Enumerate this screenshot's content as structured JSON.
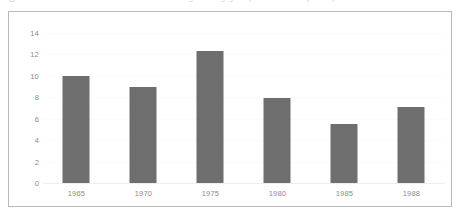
{
  "caption": {
    "text": "Figure: Number of recorded observations by survey year, 1965–1988 (units)"
  },
  "chart_data": {
    "type": "bar",
    "title": "",
    "subtitle": "",
    "xlabel": "",
    "ylabel": "",
    "categories": [
      "1965",
      "1970",
      "1975",
      "1980",
      "1985",
      "1988"
    ],
    "values": [
      10.0,
      9.0,
      12.3,
      7.9,
      5.5,
      7.1
    ],
    "series": [
      {
        "name": "Value",
        "values": [
          10.0,
          9.0,
          12.3,
          7.9,
          5.5,
          7.1
        ]
      }
    ],
    "ylim": [
      0,
      14
    ],
    "yticks": [
      0,
      2,
      4,
      6,
      8,
      10,
      12,
      14
    ],
    "ytick_labels": [
      "0",
      "2",
      "4",
      "6",
      "8",
      "10",
      "12",
      "14"
    ],
    "xtick_labels": [
      "1965",
      "1970",
      "1975",
      "1980",
      "1985",
      "1988"
    ],
    "grid": true,
    "grid_axis": "y",
    "legend": false,
    "legend_position": "none",
    "bar_color": "#6e6e6e",
    "grid_color": "#fbfbfb",
    "axis_text_color": "#8a8a8a",
    "frame_color": "#b9b9b9",
    "background_color": "#ffffff",
    "annotations": []
  }
}
